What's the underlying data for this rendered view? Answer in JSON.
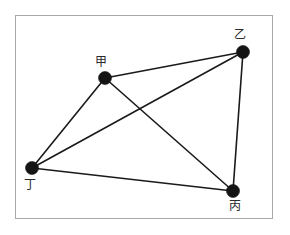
{
  "figure": {
    "title": "",
    "frame": {
      "x": 15,
      "y": 15,
      "width": 258,
      "height": 204,
      "border_color": "#a8a8a8",
      "background_color": "#ffffff"
    }
  },
  "chart_data": {
    "type": "scatter",
    "title": "",
    "xlabel": "",
    "ylabel": "",
    "grid": false,
    "legend": "none",
    "node_color": "#141414",
    "edge_color": "#1a1a1a",
    "node_radius": 6.5,
    "edge_width": 1.6,
    "nodes": [
      {
        "id": "jia",
        "label": "甲",
        "x": 105,
        "y": 78,
        "label_x": 95,
        "label_y": 56
      },
      {
        "id": "yi",
        "label": "乙",
        "x": 243,
        "y": 52,
        "label_x": 234,
        "label_y": 29
      },
      {
        "id": "bing",
        "label": "丙",
        "x": 233,
        "y": 191,
        "label_x": 229,
        "label_y": 200
      },
      {
        "id": "ding",
        "label": "丁",
        "x": 32,
        "y": 168,
        "label_x": 24,
        "label_y": 179
      }
    ],
    "edges": [
      {
        "from": "jia",
        "to": "yi"
      },
      {
        "from": "jia",
        "to": "ding"
      },
      {
        "from": "jia",
        "to": "bing"
      },
      {
        "from": "yi",
        "to": "bing"
      },
      {
        "from": "yi",
        "to": "ding"
      },
      {
        "from": "ding",
        "to": "bing"
      }
    ]
  }
}
